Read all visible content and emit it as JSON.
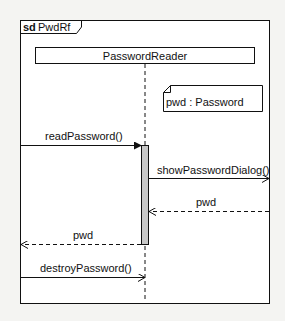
{
  "diagram": {
    "type": "uml-sequence",
    "frame": {
      "keyword": "sd",
      "name": "PwdRf"
    },
    "lifelines": [
      {
        "id": "reader",
        "label": "PasswordReader"
      }
    ],
    "note": {
      "text": "pwd : Password"
    },
    "messages": [
      {
        "label": "readPassword()",
        "kind": "sync",
        "from": "frame-left",
        "to": "reader"
      },
      {
        "label": "showPasswordDialog()",
        "kind": "async",
        "from": "reader",
        "to": "frame-right"
      },
      {
        "label": "pwd",
        "kind": "return",
        "from": "frame-right",
        "to": "reader"
      },
      {
        "label": "pwd",
        "kind": "return",
        "from": "reader",
        "to": "frame-left"
      },
      {
        "label": "destroyPassword()",
        "kind": "async",
        "from": "frame-left",
        "to": "reader"
      }
    ],
    "colors": {
      "line": "#111111",
      "activation_fill": "#c8c8c8",
      "frame_fill": "#ffffff",
      "page_bg": "#f4f4f2"
    }
  }
}
